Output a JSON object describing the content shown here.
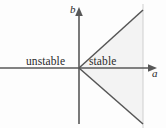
{
  "figure": {
    "type": "stability-region-diagram",
    "width": 166,
    "height": 128,
    "background_color": "#fdfdfd",
    "line_color": "#555555",
    "text_color": "#2b2b2b",
    "shade_color": "#f2f2f2",
    "guide_color": "#cfcfcf"
  },
  "axes": {
    "horizontal": {
      "label": "a",
      "name": "a-axis",
      "arrow": "right",
      "from_x": 0,
      "to_x": 152,
      "y": 68
    },
    "vertical": {
      "label": "b",
      "name": "b-axis",
      "arrow": "up",
      "x": 79,
      "from_y": 124,
      "to_y": 12
    },
    "origin": {
      "x": 79,
      "y": 68
    }
  },
  "regions": [
    {
      "label": "unstable",
      "name": "region-unstable",
      "side": "left"
    },
    {
      "label": "stable",
      "name": "region-stable",
      "side": "right-wedge"
    }
  ],
  "boundaries": [
    {
      "name": "upper-separatrix",
      "from": [
        79,
        68
      ],
      "to": [
        143,
        10
      ]
    },
    {
      "name": "lower-separatrix",
      "from": [
        79,
        68
      ],
      "to": [
        143,
        124
      ]
    }
  ],
  "guide_line": {
    "name": "vertical-guide-line",
    "x": 143,
    "from_y": 10,
    "to_y": 124
  },
  "shaded_wedge": {
    "name": "stable-wedge-shading",
    "points": "79,68 143,10 143,124"
  }
}
